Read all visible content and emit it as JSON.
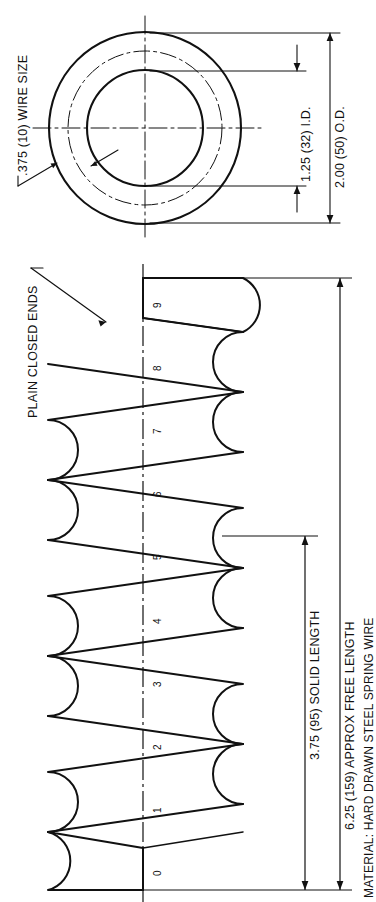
{
  "drawing": {
    "title": "Helical Compression Spring",
    "orientation": "rotated-90"
  },
  "end_view": {
    "name": "end-view",
    "wire_size_label": ".375 (10) WIRE SIZE",
    "id_label": "1.25 (32) I.D.",
    "od_label": "2.00 (50) O.D."
  },
  "side_view": {
    "name": "side-view",
    "ends_label": "PLAIN CLOSED ENDS",
    "solid_length_label": "3.75 (95) SOLID LENGTH",
    "free_length_label": "6.25 (159) APPROX FREE LENGTH",
    "coil_numbers": [
      "0",
      "1",
      "2",
      "3",
      "4",
      "5",
      "6",
      "7",
      "8",
      "9"
    ]
  },
  "notes": {
    "material_label": "MATERIAL: HARD DRAWN STEEL SPRING WIRE"
  },
  "colors": {
    "line": "#111111",
    "background": "#ffffff"
  }
}
